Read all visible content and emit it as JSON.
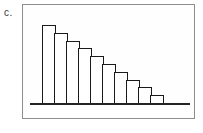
{
  "figure": {
    "label": "c."
  },
  "chart_data": {
    "type": "bar",
    "subtype": "histogram",
    "title": "",
    "xlabel": "",
    "ylabel": "",
    "values": [
      10,
      9,
      8,
      7,
      6,
      5,
      4,
      3,
      2,
      1
    ],
    "ylim": [
      0,
      10
    ],
    "grid": false,
    "legend": false,
    "axis_tick_labels": []
  },
  "colors": {
    "background": "#ffffff",
    "frame_border": "#8e8e8e",
    "bar_stroke": "#1a1a1a",
    "bar_fill": "#ffffff",
    "axis": "#242424",
    "label_color": "#3d3d3d"
  }
}
